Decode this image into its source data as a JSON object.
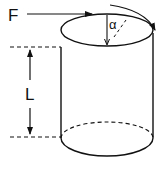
{
  "diagram": {
    "labels": {
      "force": "F",
      "angle": "α",
      "length": "L"
    },
    "colors": {
      "stroke": "#111111",
      "background": "#ffffff"
    }
  }
}
